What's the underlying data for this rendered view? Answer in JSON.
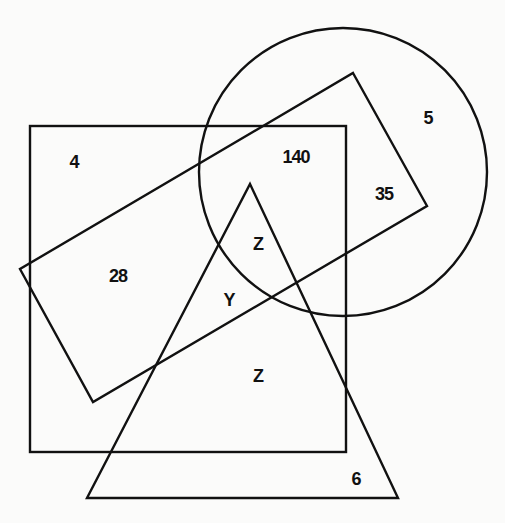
{
  "diagram": {
    "type": "venn-like overlapping shapes",
    "stroke_color": "#111111",
    "background_color": "#fbfbfa",
    "shapes": {
      "circle": {
        "cx": 343,
        "cy": 172,
        "r": 144
      },
      "square": {
        "x": 30,
        "y": 126,
        "width": 316,
        "height": 326
      },
      "rotated_rectangle": {
        "points": "353,73 427,206 93,402 20,269"
      },
      "triangle": {
        "points": "250,184 398,498 87,498"
      }
    },
    "labels": [
      {
        "id": "square-only",
        "text": "4",
        "x": 74,
        "y": 168
      },
      {
        "id": "square-circle-rect",
        "text": "140",
        "x": 296,
        "y": 163
      },
      {
        "id": "circle-only",
        "text": "5",
        "x": 428,
        "y": 124
      },
      {
        "id": "circle-rect",
        "text": "35",
        "x": 384,
        "y": 200
      },
      {
        "id": "square-rect",
        "text": "28",
        "x": 118,
        "y": 282
      },
      {
        "id": "all-four",
        "text": "Z",
        "x": 258,
        "y": 250
      },
      {
        "id": "square-rect-triangle",
        "text": "Y",
        "x": 229,
        "y": 306
      },
      {
        "id": "square-triangle",
        "text": "Z",
        "x": 258,
        "y": 382
      },
      {
        "id": "triangle-only",
        "text": "6",
        "x": 356,
        "y": 485
      }
    ]
  }
}
